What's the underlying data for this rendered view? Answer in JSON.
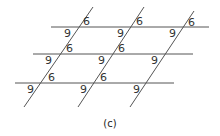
{
  "caption": "(c)",
  "figure": {
    "line_color": "#555555",
    "horizontal_lines": [
      {
        "x1": 51,
        "y": 27,
        "x2": 209
      },
      {
        "x1": 33,
        "y": 54,
        "x2": 193
      },
      {
        "x1": 15,
        "y": 83,
        "x2": 174
      }
    ],
    "transversals": [
      {
        "x1": 93,
        "y1": 7,
        "x2": 24,
        "y2": 107
      },
      {
        "x1": 144,
        "y1": 7,
        "x2": 78,
        "y2": 107
      },
      {
        "x1": 194,
        "y1": 11,
        "x2": 130,
        "y2": 107
      }
    ],
    "labels": [
      {
        "text": "6",
        "x": 83,
        "y": 25
      },
      {
        "text": "9",
        "x": 64,
        "y": 37
      },
      {
        "text": "6",
        "x": 136,
        "y": 25
      },
      {
        "text": "9",
        "x": 117,
        "y": 37
      },
      {
        "text": "6",
        "x": 188,
        "y": 26
      },
      {
        "text": "9",
        "x": 169,
        "y": 37
      },
      {
        "text": "6",
        "x": 66,
        "y": 52
      },
      {
        "text": "9",
        "x": 45,
        "y": 64
      },
      {
        "text": "6",
        "x": 118,
        "y": 52
      },
      {
        "text": "9",
        "x": 98,
        "y": 64
      },
      {
        "text": "9",
        "x": 151,
        "y": 64
      },
      {
        "text": "6",
        "x": 48,
        "y": 81
      },
      {
        "text": "9",
        "x": 27,
        "y": 93
      },
      {
        "text": "6",
        "x": 100,
        "y": 81
      },
      {
        "text": "9",
        "x": 80,
        "y": 93
      },
      {
        "text": "9",
        "x": 133,
        "y": 93
      }
    ]
  }
}
